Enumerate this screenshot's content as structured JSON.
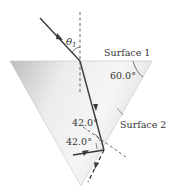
{
  "diagram": {
    "labels": {
      "theta": "θ",
      "theta_sub": "1",
      "surface1": "Surface 1",
      "surface2": "Surface 2",
      "apex_angle": "60.0°",
      "angle_incident": "42.0°",
      "angle_reflected": "42.0°"
    },
    "colors": {
      "prism_fill_light": "#f4f4f4",
      "prism_fill_dark": "#c8c8c8",
      "ray": "#3a3a3a",
      "normal": "#555555"
    }
  }
}
